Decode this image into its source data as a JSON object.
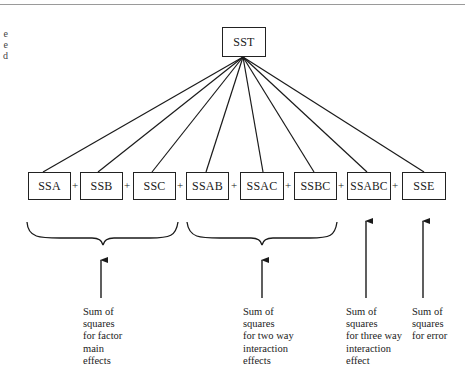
{
  "diagram": {
    "root": {
      "id": "sst",
      "label": "SST"
    },
    "components": [
      {
        "id": "ssa",
        "label": "SSA"
      },
      {
        "id": "ssb",
        "label": "SSB"
      },
      {
        "id": "ssc",
        "label": "SSC"
      },
      {
        "id": "ssab",
        "label": "SSAB"
      },
      {
        "id": "ssac",
        "label": "SSAC"
      },
      {
        "id": "ssbc",
        "label": "SSBC"
      },
      {
        "id": "ssabc",
        "label": "SSABC"
      },
      {
        "id": "sse",
        "label": "SSE"
      }
    ],
    "operator": "+",
    "groups": [
      {
        "id": "main-effects",
        "members": [
          "SSA",
          "SSB",
          "SSC"
        ],
        "annotation": "Sum of\nsquares\nfor factor\nmain\neffects"
      },
      {
        "id": "two-way",
        "members": [
          "SSAB",
          "SSAC",
          "SSBC"
        ],
        "annotation": "Sum of\nsquares\nfor two way\ninteraction\neffects"
      },
      {
        "id": "three-way",
        "members": [
          "SSABC"
        ],
        "annotation": "Sum of\nsquares\nfor three way\ninteraction\neffect"
      },
      {
        "id": "error",
        "members": [
          "SSE"
        ],
        "annotation": "Sum of\nsquares\nfor error"
      }
    ],
    "clipped_caption_fragments": "e\ne\nd"
  }
}
